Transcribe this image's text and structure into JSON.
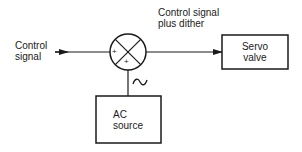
{
  "diagram": {
    "input_label": {
      "line1": "Control",
      "line2": "signal"
    },
    "output_label": {
      "line1": "Control signal",
      "line2": "plus dither"
    },
    "summing_junction": {
      "sign_left": "+",
      "sign_bottom": "+"
    },
    "servo_valve": {
      "line1": "Servo",
      "line2": "valve"
    },
    "ac_source": {
      "line1": "AC",
      "line2": "source"
    },
    "ac_symbol": "~",
    "stroke_color": "#1a1a1a",
    "background": "#ffffff"
  }
}
